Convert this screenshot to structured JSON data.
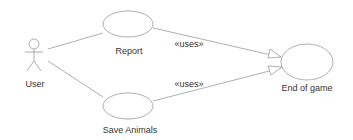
{
  "diagram": {
    "type": "uml-use-case",
    "colors": {
      "stroke": "#9a9a9a",
      "text": "#333333",
      "background": "#ffffff"
    },
    "actors": [
      {
        "id": "user",
        "label": "User"
      }
    ],
    "use_cases": [
      {
        "id": "report",
        "label": "Report"
      },
      {
        "id": "save_animals",
        "label": "Save Animals"
      },
      {
        "id": "end_of_game",
        "label": "End of game"
      }
    ],
    "relations": [
      {
        "from": "user",
        "to": "report",
        "type": "association"
      },
      {
        "from": "user",
        "to": "save_animals",
        "type": "association"
      },
      {
        "from": "report",
        "to": "end_of_game",
        "type": "uses",
        "label": "«uses»"
      },
      {
        "from": "save_animals",
        "to": "end_of_game",
        "type": "uses",
        "label": "«uses»"
      }
    ]
  }
}
